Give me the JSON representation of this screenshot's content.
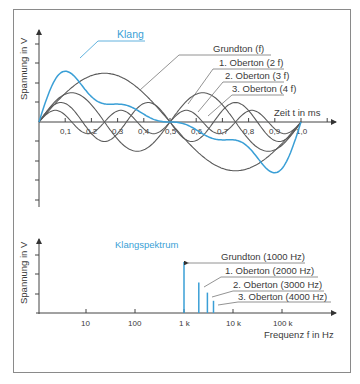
{
  "colors": {
    "accent": "#3a9fd6",
    "curve": "#5a5a5a",
    "axis": "#444444",
    "frame": "#8a8a8a"
  },
  "chart_data": [
    {
      "type": "line",
      "title": "Klang",
      "xlabel": "Zeit t in ms",
      "ylabel": "Spannung in V",
      "xlim": [
        0,
        1.1
      ],
      "x_ticks": [
        "0,1",
        "0,2",
        "0,3",
        "0,4",
        "0,5",
        "0,6",
        "0,7",
        "0,8",
        "0,9",
        "1,0"
      ],
      "grid": false,
      "series": [
        {
          "name": "Klang",
          "color": "#3a9fd6",
          "description": "sum of fundamental and 3 overtones",
          "peak": {
            "t": 0.1,
            "v": 3.4
          },
          "trough": {
            "t": 0.9,
            "v": -3.3
          }
        },
        {
          "name": "Grundton (f)",
          "frequency_factor": 1,
          "amplitude": 2.5
        },
        {
          "name": "1. Oberton (2 f)",
          "frequency_factor": 2,
          "amplitude": 1.5
        },
        {
          "name": "2. Oberton (3 f)",
          "frequency_factor": 3,
          "amplitude": 1.0
        },
        {
          "name": "3. Oberton (4 f)",
          "frequency_factor": 4,
          "amplitude": 0.6
        }
      ]
    },
    {
      "type": "bar",
      "title": "Klangspektrum",
      "xlabel": "Frequenz f in Hz",
      "ylabel": "Spannung in V",
      "x_scale": "log",
      "x_ticks": [
        "10",
        "100",
        "1 k",
        "10 k",
        "100 k"
      ],
      "categories": [
        "Grundton (1000 Hz)",
        "1. Oberton (2000 Hz)",
        "2. Oberton (3000 Hz)",
        "3. Oberton (4000 Hz)"
      ],
      "x": [
        1000,
        2000,
        3000,
        4000
      ],
      "values": [
        2.5,
        1.5,
        1.0,
        0.6
      ]
    }
  ],
  "top": {
    "ylabel": "Spannung in V",
    "xlabel": "Zeit t in ms",
    "klang": "Klang",
    "labels": [
      "Grundton (f)",
      "1. Oberton (2 f)",
      "2. Oberton (3 f)",
      "3. Oberton (4 f)"
    ],
    "ticks": [
      "0,1",
      "0,2",
      "0,3",
      "0,4",
      "0,5",
      "0,6",
      "0,7",
      "0,8",
      "0,9",
      "1,0"
    ]
  },
  "bottom": {
    "ylabel": "Spannung in V",
    "xlabel": "Frequenz f in Hz",
    "title": "Klangspektrum",
    "labels": [
      "Grundton (1000 Hz)",
      "1. Oberton (2000 Hz)",
      "2. Oberton (3000 Hz)",
      "3. Oberton (4000 Hz)"
    ],
    "ticks": [
      "10",
      "100",
      "1 k",
      "10 k",
      "100 k"
    ]
  }
}
